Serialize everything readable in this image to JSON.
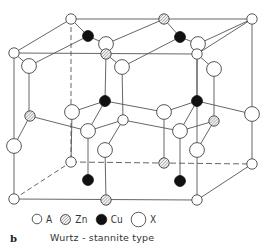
{
  "figure": {
    "panel_letter": "b",
    "caption": "Wurtz - stannite type",
    "colors": {
      "line": "#555555",
      "atom_stroke": "#444444",
      "cu_fill": "#111111",
      "zn_fill": "#d8d8d8",
      "background": "#ffffff"
    }
  },
  "legend": [
    {
      "symbol": "A",
      "label": "A",
      "style": "small-open"
    },
    {
      "symbol": "Zn",
      "label": "Zn",
      "style": "hatched"
    },
    {
      "symbol": "Cu",
      "label": "Cu",
      "style": "filled-black"
    },
    {
      "symbol": "X",
      "label": "X",
      "style": "large-open"
    }
  ],
  "structure": {
    "name": "Wurtz-stannite",
    "atoms": {
      "A": [
        [
          71,
          19
        ],
        [
          252,
          19
        ],
        [
          14,
          53
        ],
        [
          197,
          54
        ],
        [
          123,
          120
        ],
        [
          71,
          162
        ],
        [
          252,
          164
        ],
        [
          14,
          199
        ],
        [
          197,
          200
        ]
      ],
      "Zn": [
        [
          164,
          19
        ],
        [
          106,
          54
        ],
        [
          30,
          116
        ],
        [
          214,
          121
        ],
        [
          164,
          163
        ],
        [
          106,
          200
        ]
      ],
      "Cu": [
        [
          88,
          36
        ],
        [
          180,
          37
        ],
        [
          105,
          101
        ],
        [
          197,
          101
        ],
        [
          88,
          180
        ],
        [
          180,
          181
        ]
      ],
      "X": [
        [
          106,
          44
        ],
        [
          198,
          44
        ],
        [
          29,
          66
        ],
        [
          122,
          67
        ],
        [
          214,
          69
        ],
        [
          72,
          112
        ],
        [
          164,
          112
        ],
        [
          252,
          114
        ],
        [
          88,
          131
        ],
        [
          180,
          131
        ],
        [
          14,
          146
        ],
        [
          105,
          150
        ],
        [
          197,
          150
        ]
      ]
    }
  }
}
